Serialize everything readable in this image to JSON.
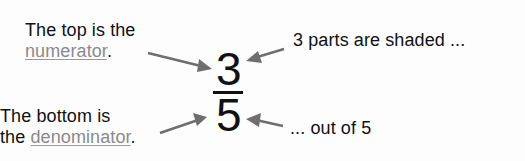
{
  "diagram": {
    "fraction": {
      "numerator": "3",
      "denominator": "5"
    },
    "left_annotations": {
      "top": {
        "line1": "The top is the",
        "term": "numerator",
        "punct": "."
      },
      "bottom": {
        "line1": "The bottom is",
        "prefix": "the ",
        "term": "denominator",
        "punct": "."
      }
    },
    "right_annotations": {
      "top": "3 parts are shaded ...",
      "bottom": "... out of 5"
    },
    "colors": {
      "text": "#111111",
      "term_link": "#8a8a8a",
      "arrow": "#6e6e6e",
      "background": "#fdfdfd"
    }
  }
}
